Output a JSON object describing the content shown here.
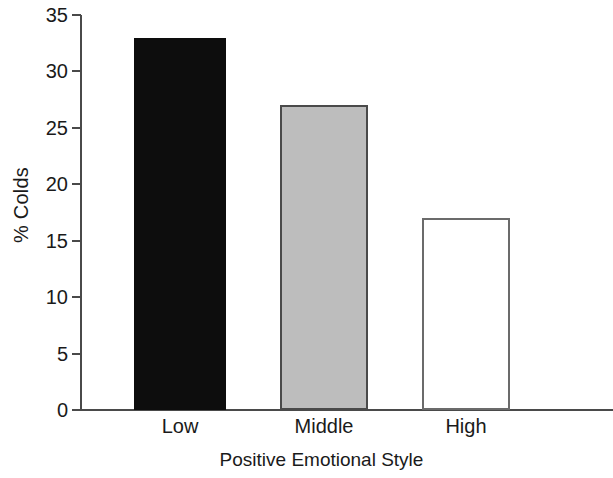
{
  "chart_data": {
    "type": "bar",
    "title": "",
    "subtitle": "",
    "xlabel": "Positive Emotional Style",
    "ylabel": "% Colds",
    "categories": [
      "Low",
      "Middle",
      "High"
    ],
    "values": [
      33,
      27,
      17
    ],
    "series": [
      {
        "name": "% Colds",
        "values": [
          33,
          27,
          17
        ]
      }
    ],
    "ylim": [
      0,
      35
    ],
    "y_ticks": [
      0,
      5,
      10,
      15,
      20,
      25,
      30,
      35
    ],
    "y_tick_labels": [
      "0",
      "5",
      "10",
      "15",
      "20",
      "25",
      "30",
      "35"
    ],
    "grid": false,
    "legend": "none",
    "bar_styles": [
      {
        "category": "Low",
        "fill": "#0d0d0d",
        "stroke": "#0d0d0d"
      },
      {
        "category": "Middle",
        "fill": "#bdbdbd",
        "stroke": "#4a4a4a"
      },
      {
        "category": "High",
        "fill": "#ffffff",
        "stroke": "#6b6b6b"
      }
    ],
    "bars": [
      {
        "label": "Low",
        "value": 33,
        "fill": "#0d0d0d",
        "stroke": "#0d0d0d",
        "left": 134,
        "width": 92
      },
      {
        "label": "Middle",
        "value": 27,
        "fill": "#bdbdbd",
        "stroke": "#4a4a4a",
        "left": 280,
        "width": 88
      },
      {
        "label": "High",
        "value": 17,
        "fill": "#ffffff",
        "stroke": "#6b6b6b",
        "left": 422,
        "width": 88
      }
    ],
    "axis_color": "#4a4a4a",
    "background": "#ffffff"
  }
}
